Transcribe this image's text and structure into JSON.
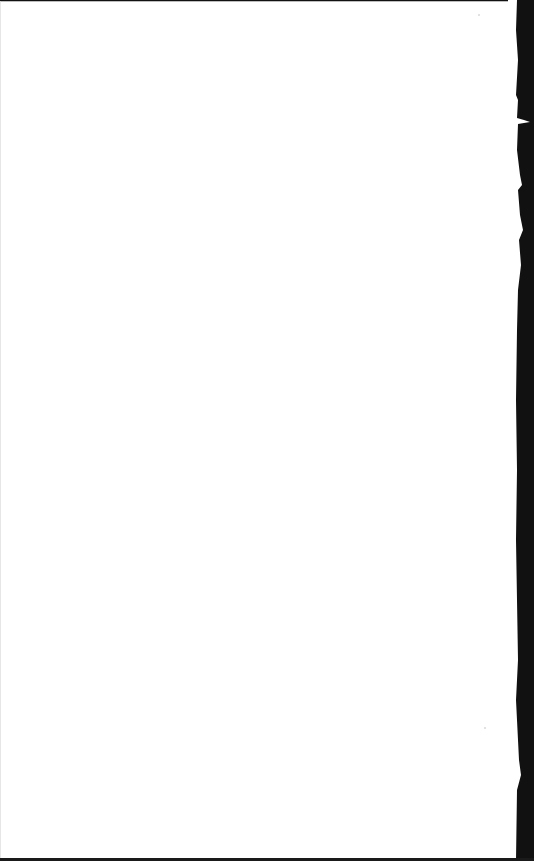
{
  "document": {
    "type": "scanned-page",
    "content": "",
    "background_color": "#ffffff",
    "edge_color": "#111111"
  }
}
